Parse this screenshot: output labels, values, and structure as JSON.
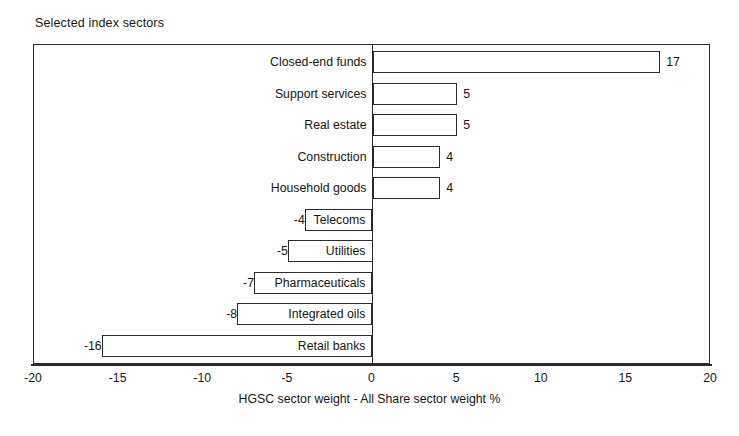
{
  "chart_data": {
    "type": "bar",
    "orientation": "horizontal",
    "title": "Selected index sectors",
    "xlabel": "HGSC sector weight - All Share sector weight %",
    "ylabel": "",
    "xlim": [
      -20,
      20
    ],
    "xticks": [
      -20,
      -15,
      -10,
      -5,
      0,
      5,
      10,
      15,
      20
    ],
    "xtick_labels": [
      "-20",
      "-15",
      "-10",
      "-5",
      "0",
      "5",
      "10",
      "15",
      "20"
    ],
    "grid": false,
    "legend": false,
    "categories": [
      "Closed-end funds",
      "Support services",
      "Real estate",
      "Construction",
      "Household goods",
      "Telecoms",
      "Utilities",
      "Pharmaceuticals",
      "Integrated oils",
      "Retail banks"
    ],
    "values": [
      17,
      5,
      5,
      4,
      4,
      -4,
      -5,
      -7,
      -8,
      -16
    ],
    "value_labels": [
      "17",
      "5",
      "5",
      "4",
      "4",
      "-4",
      "-5",
      "-7",
      "-8",
      "-16"
    ],
    "bars": [
      {
        "category": "Closed-end funds",
        "value": 17,
        "label": "17"
      },
      {
        "category": "Support services",
        "value": 5,
        "label": "5"
      },
      {
        "category": "Real estate",
        "value": 5,
        "label": "5"
      },
      {
        "category": "Construction",
        "value": 4,
        "label": "4"
      },
      {
        "category": "Household goods",
        "value": 4,
        "label": "4"
      },
      {
        "category": "Telecoms",
        "value": -4,
        "label": "-4"
      },
      {
        "category": "Utilities",
        "value": -5,
        "label": "-5"
      },
      {
        "category": "Pharmaceuticals",
        "value": -7,
        "label": "-7"
      },
      {
        "category": "Integrated oils",
        "value": -8,
        "label": "-8"
      },
      {
        "category": "Retail banks",
        "value": -16,
        "label": "-16"
      }
    ],
    "colors": {
      "bar_fill": "#ffffff",
      "bar_edge": "#2b2b2b",
      "axis": "#2b2b2b",
      "text": "#161616",
      "background": "#ffffff"
    }
  }
}
